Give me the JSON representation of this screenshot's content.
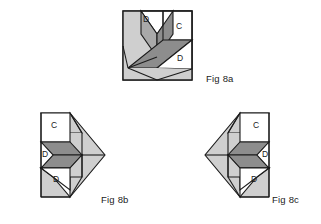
{
  "page": {
    "background_color": "#ffffff"
  },
  "palette": {
    "outline": "#1b1b1b",
    "light_gray": "#cfcfcf",
    "mid_gray": "#a9a9a9",
    "dark_gray": "#8d8d8d",
    "white": "#ffffff",
    "label_text": "#1a1a1a"
  },
  "figures": [
    {
      "id": "fig-8a",
      "caption": "Fig 8a",
      "description": "Square block with three-diamond pinwheel, corner square C and notch triangles D",
      "labels": [
        {
          "id": "a-label-d-top",
          "text": "D"
        },
        {
          "id": "a-label-c",
          "text": "C"
        },
        {
          "id": "a-label-d-right",
          "text": "D"
        }
      ]
    },
    {
      "id": "fig-8b",
      "caption": "Fig 8b",
      "description": "Partial block, arrow pointing right, with square C and two triangles D",
      "labels": [
        {
          "id": "b-label-c",
          "text": "C"
        },
        {
          "id": "b-label-d-mid",
          "text": "D"
        },
        {
          "id": "b-label-d-bottom",
          "text": "D"
        }
      ]
    },
    {
      "id": "fig-8c",
      "caption": "Fig 8c",
      "description": "Mirrored partial block, arrow pointing left, with square C and two triangles D",
      "labels": [
        {
          "id": "c-label-c",
          "text": "C"
        },
        {
          "id": "c-label-d-mid",
          "text": "D"
        },
        {
          "id": "c-label-d-bottom",
          "text": "D"
        }
      ]
    }
  ],
  "captions": {
    "fig_a": "Fig 8a",
    "fig_b": "Fig 8b",
    "fig_c": "Fig 8c"
  }
}
